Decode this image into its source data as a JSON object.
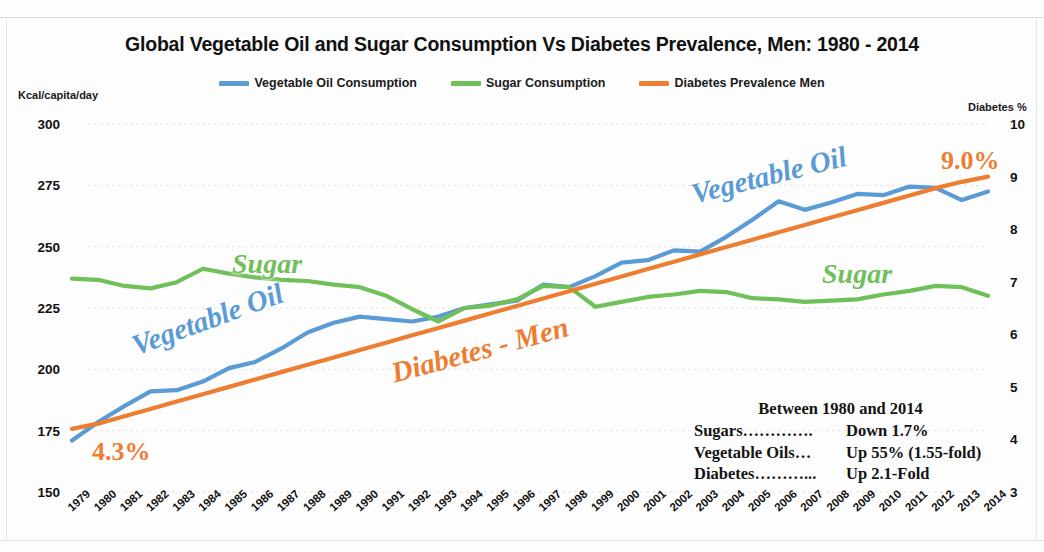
{
  "title": "Global Vegetable Oil and Sugar Consumption Vs Diabetes Prevalence, Men: 1980 - 2014",
  "legend": [
    {
      "label": "Vegetable Oil Consumption",
      "color": "#5b9bd5",
      "name": "legend-vegetable-oil"
    },
    {
      "label": "Sugar Consumption",
      "color": "#70c05a",
      "name": "legend-sugar"
    },
    {
      "label": "Diabetes Prevalence Men",
      "color": "#ed7d31",
      "name": "legend-diabetes"
    }
  ],
  "axes": {
    "left_caption": "Kcal/capita/day",
    "right_caption": "Diabetes %"
  },
  "inline_labels": {
    "vegetable_oil_left": "Vegetable Oil",
    "vegetable_oil_right": "Vegetable Oil",
    "sugar_left": "Sugar",
    "sugar_right": "Sugar",
    "diabetes": "Diabetes - Men"
  },
  "callouts": {
    "start_value": "4.3%",
    "end_value": "9.0%"
  },
  "summary": {
    "heading": "Between 1980 and 2014",
    "rows": [
      {
        "key": "Sugars………….",
        "value": "Down 1.7%"
      },
      {
        "key": "Vegetable Oils…",
        "value": "Up 55% (1.55-fold)"
      },
      {
        "key": "Diabetes………...",
        "value": "Up 2.1-Fold"
      }
    ]
  },
  "chart_data": {
    "type": "line",
    "title": "Global Vegetable Oil and Sugar Consumption Vs Diabetes Prevalence, Men: 1980 - 2014",
    "xlabel": "",
    "ylabel": "Kcal/capita/day",
    "y2label": "Diabetes %",
    "grid": true,
    "legend_position": "top-center",
    "x": [
      1979,
      1980,
      1981,
      1982,
      1983,
      1984,
      1985,
      1986,
      1987,
      1988,
      1989,
      1990,
      1991,
      1992,
      1993,
      1994,
      1995,
      1996,
      1997,
      1998,
      1999,
      2000,
      2001,
      2002,
      2003,
      2004,
      2005,
      2006,
      2007,
      2008,
      2009,
      2010,
      2011,
      2012,
      2013,
      2014
    ],
    "ylim": [
      150,
      300
    ],
    "yticks": [
      150,
      175,
      200,
      225,
      250,
      275,
      300
    ],
    "y2lim": [
      3,
      10
    ],
    "y2ticks": [
      3,
      4,
      5,
      6,
      7,
      8,
      9,
      10
    ],
    "series": [
      {
        "name": "Vegetable Oil Consumption",
        "axis": "left",
        "color": "#5b9bd5",
        "values": [
          171,
          178.5,
          185,
          191,
          191.5,
          195,
          200.5,
          203,
          208.5,
          215,
          219,
          221.5,
          220.5,
          219.5,
          221.5,
          225,
          226.5,
          228,
          234.5,
          233.5,
          238,
          243.5,
          244.5,
          248.5,
          248,
          254,
          261,
          268.5,
          265,
          268,
          271.5,
          271,
          274.5,
          274,
          269,
          272.5
        ]
      },
      {
        "name": "Sugar Consumption",
        "axis": "left",
        "color": "#70c05a",
        "values": [
          237,
          236.5,
          234,
          233,
          235.5,
          241,
          239,
          237.5,
          236.5,
          236,
          234.5,
          233.5,
          230,
          224.5,
          219.5,
          225,
          226,
          228.5,
          234,
          233.5,
          225.5,
          227.5,
          229.5,
          230.5,
          232,
          231.5,
          229,
          228.5,
          227.5,
          228,
          228.5,
          230.5,
          232,
          234,
          233.5,
          230
        ]
      },
      {
        "name": "Diabetes Prevalence Men",
        "axis": "right",
        "color": "#ed7d31",
        "values": [
          4.2,
          4.3,
          4.44,
          4.58,
          4.72,
          4.86,
          5.0,
          5.14,
          5.28,
          5.42,
          5.56,
          5.7,
          5.84,
          5.98,
          6.12,
          6.26,
          6.4,
          6.54,
          6.68,
          6.82,
          6.96,
          7.1,
          7.24,
          7.38,
          7.52,
          7.66,
          7.8,
          7.94,
          8.08,
          8.22,
          8.36,
          8.5,
          8.64,
          8.78,
          8.9,
          9.0
        ]
      }
    ]
  }
}
